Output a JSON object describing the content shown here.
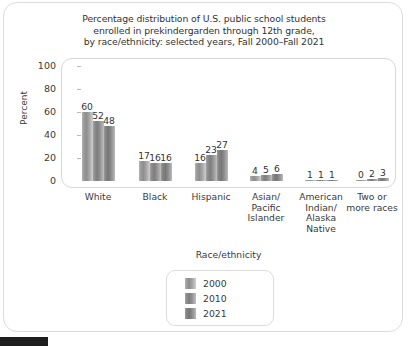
{
  "figure": {
    "title_lines": [
      "Percentage distribution of U.S. public school students",
      "enrolled in prekindergarden through 12th grade,",
      "by race/ethnicity: selected years, Fall 2000–Fall 2021"
    ],
    "title_line_1": "Percentage distribution of U.S. public school students",
    "title_line_2": "enrolled in prekindergarden through 12th grade,",
    "title_line_3": "by race/ethnicity: selected years, Fall 2000–Fall 2021"
  },
  "axes": {
    "ylabel": "Percent",
    "xlabel": "Race/ethnicity",
    "yticks": [
      "100",
      "80",
      "60",
      "40",
      "20",
      "0"
    ]
  },
  "legend": {
    "items": [
      {
        "label": "2000",
        "color": "#8e8e8e"
      },
      {
        "label": "2010",
        "color": "#7e7e7e"
      },
      {
        "label": "2021",
        "color": "#777777"
      }
    ]
  },
  "categories_display": [
    {
      "lines": [
        "White"
      ]
    },
    {
      "lines": [
        "Black"
      ]
    },
    {
      "lines": [
        "Hispanic"
      ]
    },
    {
      "lines": [
        "Asian/",
        "Pacific",
        "Islander"
      ]
    },
    {
      "lines": [
        "American",
        "Indian/",
        "Alaska",
        "Native"
      ]
    },
    {
      "lines": [
        "Two or",
        "more races"
      ]
    }
  ],
  "chart_data": {
    "type": "bar",
    "title": "Percentage distribution of U.S. public school students enrolled in prekindergarden through 12th grade, by race/ethnicity: selected years, Fall 2000–Fall 2021",
    "xlabel": "Race/ethnicity",
    "ylabel": "Percent",
    "ylim": [
      0,
      100
    ],
    "yticks": [
      0,
      20,
      40,
      60,
      80,
      100
    ],
    "grid": false,
    "legend_position": "bottom-center",
    "categories": [
      "White",
      "Black",
      "Hispanic",
      "Asian/Pacific Islander",
      "American Indian/Alaska Native",
      "Two or more races"
    ],
    "series": [
      {
        "name": "2000",
        "values": [
          60,
          17,
          16,
          4,
          1,
          0
        ]
      },
      {
        "name": "2010",
        "values": [
          52,
          16,
          23,
          5,
          1,
          2
        ]
      },
      {
        "name": "2021",
        "values": [
          48,
          16,
          27,
          6,
          1,
          3
        ]
      }
    ]
  }
}
